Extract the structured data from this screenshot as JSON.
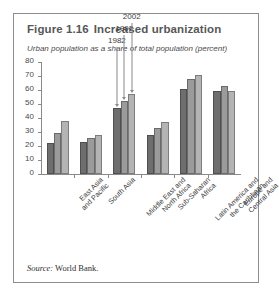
{
  "figure": {
    "number": "Figure 1.16",
    "title": "Increased urbanization",
    "subtitle": "Urban population as a share of total population (percent)",
    "source_word": "Source:",
    "source_text": "World Bank."
  },
  "chart_data": {
    "type": "bar",
    "title": "Increased urbanization",
    "subtitle": "Urban population as a share of total population (percent)",
    "xlabel": "",
    "ylabel": "",
    "ylim": [
      0,
      80
    ],
    "yticks": [
      0,
      10,
      20,
      30,
      40,
      50,
      60,
      70,
      80
    ],
    "ytick_labels": [
      "0",
      "10",
      "20",
      "30",
      "40",
      "50",
      "60",
      "70",
      "80"
    ],
    "grid": false,
    "legend": "none",
    "categories": [
      "East Asia and Pacific",
      "South Asia",
      "Middle East and North Africa",
      "Sub-Saharan Africa",
      "Latin America and the Caribbean",
      "Europe and Central Asia"
    ],
    "category_lines": [
      [
        "East Asia",
        "and Pacific"
      ],
      [
        "South Asia"
      ],
      [
        "Middle East and",
        "North Africa"
      ],
      [
        "Sub-Saharan",
        "Africa"
      ],
      [
        "Latin America and",
        "the Caribbean"
      ],
      [
        "Europe and",
        "Central Asia"
      ]
    ],
    "series": [
      {
        "name": "1982",
        "color": "#6e6e6e",
        "values": [
          22,
          23,
          47,
          28,
          61,
          59
        ]
      },
      {
        "name": "1992",
        "color": "#9b9b9b",
        "values": [
          29,
          25.5,
          52,
          33,
          68,
          63
        ]
      },
      {
        "name": "2002",
        "color": "#b4b4b4",
        "values": [
          38,
          28,
          57,
          37,
          71,
          59
        ]
      }
    ],
    "annotations": [
      {
        "label": "1982",
        "series": "1982",
        "category": "Middle East and North Africa"
      },
      {
        "label": "1992",
        "series": "1992",
        "category": "Middle East and North Africa"
      },
      {
        "label": "2002",
        "series": "2002",
        "category": "Middle East and North Africa"
      }
    ]
  }
}
